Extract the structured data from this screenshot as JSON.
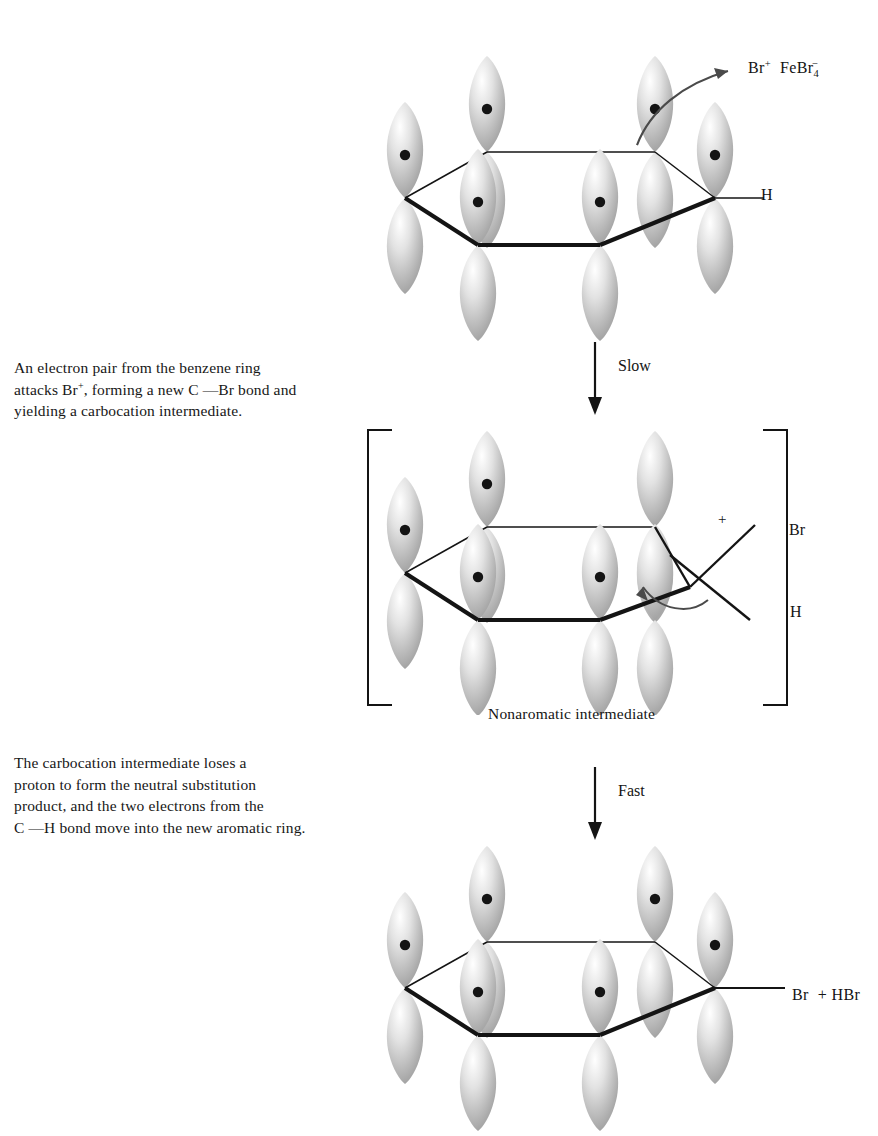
{
  "figure": {
    "type": "reaction-mechanism-diagram",
    "background_color": "#ffffff",
    "line_color": "#141414",
    "orbital_fill": "#b8b8b8"
  },
  "captions": [
    {
      "id": "step-1",
      "lines": [
        "An electron pair from the benzene ring",
        "attacks Br , forming a new C    Br bond and",
        "yielding a carbocation intermediate."
      ],
      "line2_parts": {
        "before": "attacks Br",
        "superscript": "+",
        "middle": ", forming a new C ",
        "dash": "—",
        "after": "Br bond and"
      }
    },
    {
      "id": "step-2",
      "lines": [
        "The carbocation intermediate loses a",
        "proton to form the neutral substitution",
        "product, and the two electrons from the",
        "C    H bond move into the new aromatic ring."
      ],
      "line4_parts": {
        "before": "C ",
        "dash": "—",
        "after": "H bond move into the new aromatic ring."
      }
    }
  ],
  "labels": {
    "reagent": {
      "species1": "Br",
      "species1_charge": "+",
      "species2a": "FeBr",
      "species2_sub": "4",
      "species2_charge": "−"
    },
    "top_h": "H",
    "slow_arrow": "Slow",
    "fast_arrow": "Fast",
    "mid_br": "Br",
    "mid_h": "H",
    "mid_plus": "+",
    "intermediate_caption": "Nonaromatic intermediate",
    "product_br": "Br",
    "product_plus": "+",
    "product_hbr": "HBr"
  },
  "structures": [
    {
      "id": "benzene-reactant",
      "name": "benzene-pi-system",
      "substituent": "H",
      "ring_charge": null,
      "orbital_count": 6,
      "electron_dots": 6,
      "curved_arrow": "electron-pair-to-bromine"
    },
    {
      "id": "arenium-intermediate",
      "name": "carbocation-intermediate",
      "substituents": [
        "Br",
        "H"
      ],
      "ring_charge": "+",
      "orbital_count": 6,
      "electron_dots": 4,
      "brackets": true,
      "curved_arrow": "proton-loss"
    },
    {
      "id": "bromobenzene-product",
      "name": "aromatic-product",
      "substituent": "Br",
      "byproduct": "HBr",
      "orbital_count": 6,
      "electron_dots": 6
    }
  ],
  "arrows": [
    {
      "id": "slow",
      "label": "Slow",
      "direction": "down"
    },
    {
      "id": "fast",
      "label": "Fast",
      "direction": "down"
    }
  ]
}
